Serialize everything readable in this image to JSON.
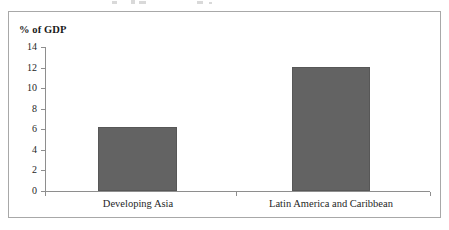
{
  "figure": {
    "frame_border_color": "#a8a8a8",
    "background_color": "#ffffff"
  },
  "chart_data": {
    "type": "bar",
    "title": "",
    "subtitle": "",
    "xlabel": "",
    "ylabel": "% of GDP",
    "categories": [
      "Developing Asia",
      "Latin America and Caribbean"
    ],
    "values": [
      6.2,
      12.1
    ],
    "series": [
      {
        "name": "% of GDP",
        "values": [
          6.2,
          12.1
        ]
      }
    ],
    "ylim": [
      0,
      14
    ],
    "ytick_step": 2,
    "ytick_labels": [
      "0",
      "2",
      "4",
      "6",
      "8",
      "10",
      "12",
      "14"
    ],
    "ytick_values": [
      0,
      2,
      4,
      6,
      8,
      10,
      12,
      14
    ],
    "grid": false,
    "legend": false,
    "legend_position": "none",
    "bar_color": "#636363",
    "bar_edge_color": "#575757",
    "axis_color": "#8e8e8e"
  }
}
